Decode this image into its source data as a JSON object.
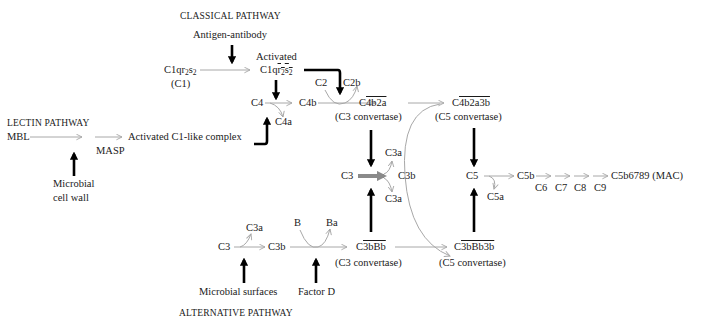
{
  "headers": {
    "classical": "CLASSICAL PATHWAY",
    "lectin": "LECTIN PATHWAY",
    "alternative": "ALTERNATIVE PATHWAY"
  },
  "classical": {
    "trigger": "Antigen-antibody",
    "c1_prefix": "C1qr",
    "c1_sub1": "2",
    "c1_s": "s",
    "c1_sub2": "2",
    "c1_label": "(C1)",
    "activated_label": "Activated",
    "act_prefix": "C1q",
    "act_r": "r",
    "act_sub1": "2",
    "act_s": "s",
    "act_sub2": "2",
    "c4": "C4",
    "c4a": "C4a",
    "c4b": "C4b",
    "c2": "C2",
    "c2b": "C2b",
    "c3_convertase_prefix": "C",
    "c3_convertase_ov": "4b2a",
    "c3_convertase_label": "(C3 convertase)",
    "c5_convertase_prefix": "C",
    "c5_convertase_ov": "4b2a3b",
    "c5_convertase_label": "(C5 convertase)"
  },
  "lectin": {
    "mbl": "MBL",
    "masp": "MASP",
    "trigger_line1": "Microbial",
    "trigger_line2": "cell wall",
    "complex": "Activated C1-like complex"
  },
  "central": {
    "c3": "C3",
    "c3a_top": "C3a",
    "c3a_bottom": "C3a",
    "c3b": "C3b",
    "c5": "C5",
    "c5a": "C5a",
    "c5b": "C5b",
    "c6": "C6",
    "c7": "C7",
    "c8": "C8",
    "c9": "C9",
    "mac": "C5b6789 (MAC)"
  },
  "alternative": {
    "c3": "C3",
    "c3a": "C3a",
    "c3b": "C3b",
    "b": "B",
    "ba": "Ba",
    "trigger1": "Microbial surfaces",
    "trigger2": "Factor D",
    "c3_convertase_prefix": "C",
    "c3_convertase_ov": "3bBb",
    "c3_convertase_label": "(C3 convertase)",
    "c5_convertase_prefix": "C",
    "c5_convertase_ov": "3bBb3b",
    "c5_convertase_label": "(C5 convertase)"
  },
  "colors": {
    "text": "#1a1a1a",
    "thin_arrow": "#a8a8a8",
    "thick_arrow": "#000000",
    "c3_cleavage_arrow": "#8a8a8a"
  }
}
